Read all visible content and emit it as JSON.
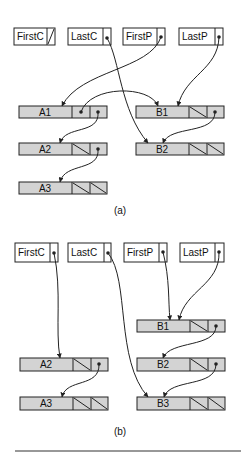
{
  "colors": {
    "node_fill": "#d3d3d3",
    "stroke": "#222222",
    "header_fill": "#ffffff",
    "background": "#ffffff"
  },
  "panel_a": {
    "caption": "(a)",
    "headers": [
      {
        "label": "FirstC",
        "pointer": "null"
      },
      {
        "label": "LastC",
        "pointer": "B2"
      },
      {
        "label": "FirstP",
        "pointer": "A1"
      },
      {
        "label": "LastP",
        "pointer": "B1"
      }
    ],
    "nodes": [
      {
        "label": "A1",
        "ptr1": "B1",
        "ptr2": "A2"
      },
      {
        "label": "A2",
        "ptr1": "null",
        "ptr2": "A3"
      },
      {
        "label": "A3",
        "ptr1": "null",
        "ptr2": "null"
      },
      {
        "label": "B1",
        "ptr1": "null",
        "ptr2": "B2"
      },
      {
        "label": "B2",
        "ptr1": "null",
        "ptr2": "null"
      }
    ]
  },
  "panel_b": {
    "caption": "(b)",
    "headers": [
      {
        "label": "FirstC",
        "pointer": "A2"
      },
      {
        "label": "LastC",
        "pointer": "B3"
      },
      {
        "label": "FirstP",
        "pointer": "B1"
      },
      {
        "label": "LastP",
        "pointer": "B1"
      }
    ],
    "nodes": [
      {
        "label": "B1",
        "ptr1": "null",
        "ptr2": "B2"
      },
      {
        "label": "A2",
        "ptr1": "null",
        "ptr2": "A3"
      },
      {
        "label": "B2",
        "ptr1": "null",
        "ptr2": "B3"
      },
      {
        "label": "A3",
        "ptr1": "null",
        "ptr2": "null"
      },
      {
        "label": "B3",
        "ptr1": "null",
        "ptr2": "null"
      }
    ]
  }
}
